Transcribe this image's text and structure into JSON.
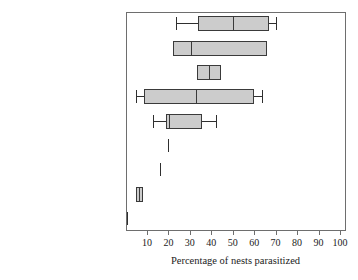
{
  "chart_data": {
    "type": "box",
    "title": "",
    "xlabel": "Percentage of nests parasitized",
    "ylabel": "",
    "xlim": [
      0,
      100
    ],
    "xticks": [
      10,
      20,
      30,
      40,
      50,
      60,
      70,
      80,
      90,
      100
    ],
    "xtick_labels": [
      "10",
      "20",
      "30",
      "40",
      "50",
      "60",
      "70",
      "80",
      "90",
      "100"
    ],
    "grid": false,
    "legend": null,
    "orientation": "horizontal",
    "categories": [
      "Common Goldeneye",
      "Barrow's Goldeneye",
      "Hooded Merganser",
      "Red-breasted Merganser",
      "Common Eider",
      "Common Merganser",
      "King Eider",
      "Bufflehead",
      "Spectacled Eider"
    ],
    "boxes": [
      {
        "category": "Common Goldeneye",
        "whisker_low": 23.5,
        "q1": 34,
        "median": 50,
        "q3": 67,
        "whisker_high": 70,
        "has_whiskers": true,
        "has_box": true
      },
      {
        "category": "Barrow's Goldeneye",
        "whisker_low": 22,
        "q1": 22,
        "median": 30.5,
        "q3": 66,
        "whisker_high": 66,
        "has_whiskers": false,
        "has_box": true
      },
      {
        "category": "Hooded Merganser",
        "whisker_low": 33.5,
        "q1": 33.5,
        "median": 39,
        "q3": 44.5,
        "whisker_high": 44.5,
        "has_whiskers": false,
        "has_box": true
      },
      {
        "category": "Red-breasted Merganser",
        "whisker_low": 5,
        "q1": 8.5,
        "median": 33,
        "q3": 60,
        "whisker_high": 63.5,
        "has_whiskers": true,
        "has_box": true
      },
      {
        "category": "Common Eider",
        "whisker_low": 13,
        "q1": 19,
        "median": 20.5,
        "q3": 35.5,
        "whisker_high": 42,
        "has_whiskers": true,
        "has_box": true
      },
      {
        "category": "Common Merganser",
        "whisker_low": 20,
        "q1": 20,
        "median": 20,
        "q3": 20,
        "whisker_high": 20,
        "has_whiskers": false,
        "has_box": false
      },
      {
        "category": "King Eider",
        "whisker_low": 16,
        "q1": 16,
        "median": 16,
        "q3": 16,
        "whisker_high": 16,
        "has_whiskers": false,
        "has_box": false
      },
      {
        "category": "Bufflehead",
        "whisker_low": 5,
        "q1": 5,
        "median": 6.3,
        "q3": 8,
        "whisker_high": 8,
        "has_whiskers": false,
        "has_box": true
      },
      {
        "category": "Spectacled Eider",
        "whisker_low": 0.5,
        "q1": 0.5,
        "median": 0.5,
        "q3": 0.5,
        "whisker_high": 0.5,
        "has_whiskers": false,
        "has_box": false
      }
    ],
    "colors": {
      "box_fill": "#cccccc",
      "box_edge": "#3a3a3a",
      "whisker": "#2f2f2f",
      "frame": "#6e6e6e",
      "text": "#1b1b1b",
      "background": "#ffffff"
    }
  }
}
